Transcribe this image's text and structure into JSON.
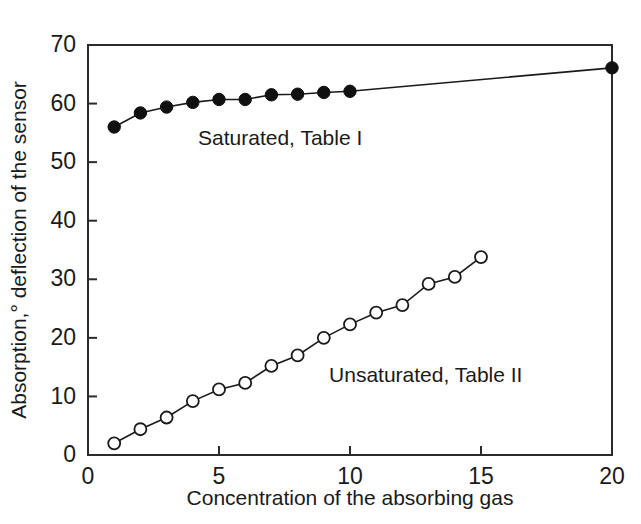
{
  "chart_data": {
    "type": "line",
    "title": "",
    "xlabel": "Concentration of the absorbing gas",
    "ylabel": "Absorption,° deflection of the sensor",
    "xlim": [
      0,
      20
    ],
    "ylim": [
      0,
      70
    ],
    "xticks": [
      0,
      5,
      10,
      15,
      20
    ],
    "xtick_labels": [
      "0",
      "5",
      "10",
      "15",
      "20"
    ],
    "yticks": [
      0,
      10,
      20,
      30,
      40,
      50,
      60,
      70
    ],
    "ytick_labels": [
      "0",
      "10",
      "20",
      "30",
      "40",
      "50",
      "60",
      "70"
    ],
    "grid": false,
    "legend_position": "inline-annotations",
    "series": [
      {
        "name": "Saturated, Table I",
        "marker": "filled-circle",
        "marker_color": "#101010",
        "line_color": "#1a1a1a",
        "x": [
          1,
          2,
          3,
          4,
          5,
          6,
          7,
          8,
          9,
          10,
          20
        ],
        "values": [
          56.0,
          58.4,
          59.4,
          60.2,
          60.7,
          60.7,
          61.5,
          61.6,
          61.9,
          62.1,
          66.1
        ],
        "annotation": {
          "text": "Saturated, Table I",
          "x": 4.2,
          "y": 53.0
        }
      },
      {
        "name": "Unsaturated, Table II",
        "marker": "open-circle",
        "marker_color": "#ffffff",
        "line_color": "#1a1a1a",
        "x": [
          1,
          2,
          3,
          4,
          5,
          6,
          7,
          8,
          9,
          10,
          11,
          12,
          13,
          14,
          15
        ],
        "values": [
          2.0,
          4.4,
          6.4,
          9.2,
          11.2,
          12.3,
          15.2,
          17.0,
          20.0,
          22.3,
          24.3,
          25.6,
          29.2,
          30.4,
          33.8
        ],
        "annotation": {
          "text": "Unsaturated, Table II",
          "x": 9.2,
          "y": 12.5
        }
      }
    ],
    "colors": {
      "axis": "#2b2b2b",
      "text": "#1a1a1a",
      "background": "#ffffff",
      "filled_marker": "#101010",
      "open_marker_stroke": "#1a1a1a"
    }
  }
}
